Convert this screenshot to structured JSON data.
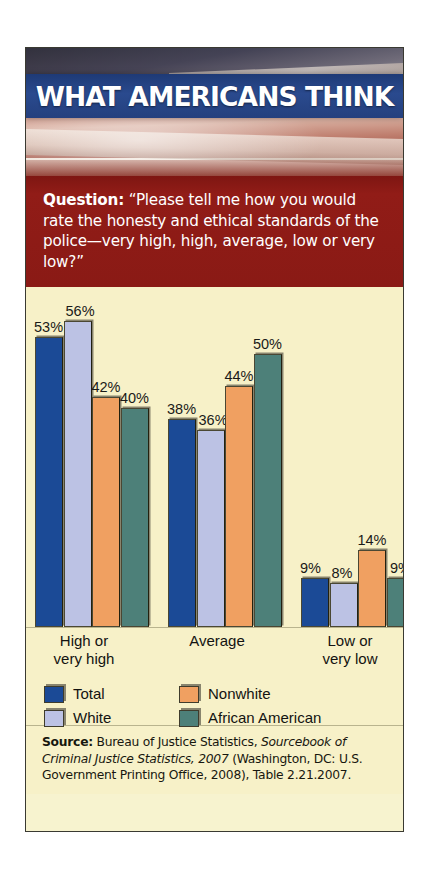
{
  "card": {
    "banner_title": "WHAT AMERICANS THINK",
    "question_prefix": "Question:",
    "question_body": " “Please tell me how you would rate the honesty and ethical standards of the police—very high, high, average, low or very low?”"
  },
  "colors": {
    "banner_blue": "#24407e",
    "question_red": "#8d1b17",
    "chart_background": "#f7f1c8",
    "total": "#1b4a96",
    "white": "#bcc2e4",
    "nonwhite": "#f0a061",
    "african_american": "#4d8079",
    "label_text": "#131311"
  },
  "chart_data": {
    "type": "bar",
    "title": "",
    "xlabel": "",
    "ylabel": "",
    "ylim": [
      0,
      60
    ],
    "grid": false,
    "legend_position": "bottom",
    "categories": [
      "High or very high",
      "Average",
      "Low or very low"
    ],
    "category_lines": [
      [
        "High or",
        "very high"
      ],
      [
        "Average"
      ],
      [
        "Low or",
        "very low"
      ]
    ],
    "series": [
      {
        "name": "Total",
        "color": "#1b4a96",
        "values": [
          53,
          38,
          9
        ],
        "labels": [
          "53%",
          "38%",
          "9%"
        ]
      },
      {
        "name": "White",
        "color": "#bcc2e4",
        "values": [
          56,
          36,
          8
        ],
        "labels": [
          "56%",
          "36%",
          "8%"
        ]
      },
      {
        "name": "Nonwhite",
        "color": "#f0a061",
        "values": [
          42,
          44,
          14
        ],
        "labels": [
          "42%",
          "44%",
          "14%"
        ]
      },
      {
        "name": "African American",
        "color": "#4d8079",
        "values": [
          40,
          50,
          9
        ],
        "labels": [
          "40%",
          "50%",
          "9%"
        ]
      }
    ]
  },
  "legend": {
    "items": [
      {
        "label": "Total",
        "color": "#1b4a96"
      },
      {
        "label": "White",
        "color": "#bcc2e4"
      },
      {
        "label": "Nonwhite",
        "color": "#f0a061"
      },
      {
        "label": "African American",
        "color": "#4d8079"
      }
    ]
  },
  "source": {
    "prefix": "Source:",
    "text_1": " Bureau of Justice Statistics, ",
    "italic_1": "Sourcebook of Criminal Justice Statistics, 2007",
    "text_2": " (Washington, DC:  U.S. Government Printing Office, 2008), Table 2.21.2007."
  }
}
